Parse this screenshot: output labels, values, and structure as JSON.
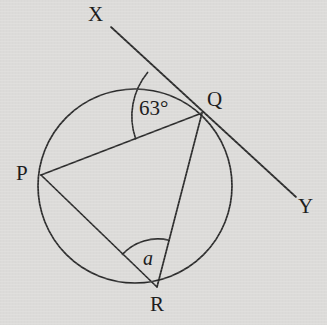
{
  "figure": {
    "kind": "circle-geometry-diagram",
    "background_color": "#dcdbd9",
    "stroke_color": "#2b2b2b",
    "circle": {
      "cx": 135,
      "cy": 186,
      "r": 97
    },
    "points": {
      "P": {
        "x": 41,
        "y": 175,
        "label": "P",
        "label_x": 16,
        "label_y": 163
      },
      "Q": {
        "x": 202,
        "y": 113,
        "label": "Q",
        "label_x": 207,
        "label_y": 89
      },
      "R": {
        "x": 157,
        "y": 287,
        "label": "R",
        "label_x": 150,
        "label_y": 294
      },
      "X": {
        "x": 111,
        "y": 27,
        "label": "X",
        "label_x": 88,
        "label_y": 4
      },
      "Y": {
        "x": 296,
        "y": 197,
        "label": "Y",
        "label_x": 298,
        "label_y": 196
      }
    },
    "segments": [
      {
        "name": "tangent-XY",
        "from": "X",
        "to": "Y"
      },
      {
        "name": "chord-PQ",
        "from": "P",
        "to": "Q"
      },
      {
        "name": "chord-PR",
        "from": "P",
        "to": "R"
      },
      {
        "name": "chord-QR",
        "from": "Q",
        "to": "R"
      }
    ],
    "angles": [
      {
        "name": "angle-XQP",
        "vertex": "Q",
        "value": "63°",
        "label": "63°",
        "label_x": 139,
        "label_y": 98,
        "arc_radius": 69
      },
      {
        "name": "angle-PRQ",
        "vertex": "R",
        "value": "a",
        "label": "a",
        "label_x": 143,
        "label_y": 248,
        "arc_radius": 48
      }
    ]
  }
}
